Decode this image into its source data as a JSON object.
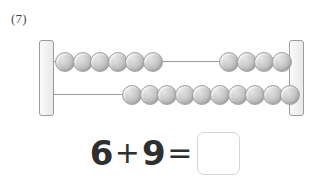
{
  "problem": {
    "number_label": "(7)"
  },
  "abacus": {
    "name": "rekenrek-abacus",
    "rows": [
      {
        "row_label": "top-row",
        "total_beads": 10,
        "groups": [
          {
            "position": "left",
            "count": 6
          },
          {
            "position": "right",
            "count": 4
          }
        ]
      },
      {
        "row_label": "bottom-row",
        "total_beads": 10,
        "groups": [
          {
            "position": "right",
            "count": 10
          }
        ]
      }
    ],
    "colors": {
      "bead": "#bdbdbd",
      "bead_border": "#a3a3a3",
      "rod": "#9a9a9a",
      "post_fill": "#f2f2f2",
      "post_border": "#9c9c9c"
    }
  },
  "equation": {
    "first_addend": "6",
    "operator_plus": "+",
    "second_addend": "9",
    "operator_equals": "=",
    "answer_value": "",
    "answer_placeholder": ""
  }
}
